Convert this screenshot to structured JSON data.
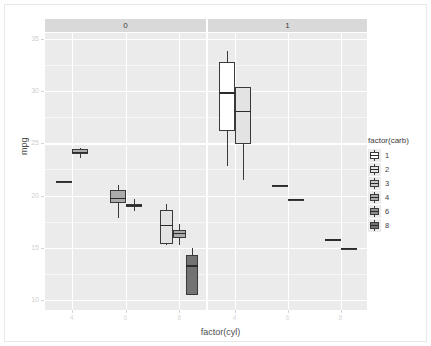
{
  "chart_data": {
    "type": "box",
    "title": "",
    "xlabel": "factor(cyl)",
    "ylabel": "mpg",
    "ylim": [
      9.0,
      35.6
    ],
    "yticks": [
      10,
      15,
      20,
      25,
      30,
      35
    ],
    "ytick_labels": [
      "10",
      "15",
      "20",
      "25",
      "30",
      "35"
    ],
    "xticks": [
      4,
      6,
      8
    ],
    "xtick_labels": [
      "4",
      "6",
      "8"
    ],
    "grid": "major-minor-white-on-gray",
    "legend": {
      "title": "factor(carb)",
      "position": "right",
      "entries": [
        {
          "label": "1",
          "color": "#ffffff"
        },
        {
          "label": "2",
          "color": "#e3e3e3"
        },
        {
          "label": "3",
          "color": "#c8c8c8"
        },
        {
          "label": "4",
          "color": "#ababab"
        },
        {
          "label": "6",
          "color": "#8e8e8e"
        },
        {
          "label": "8",
          "color": "#737373"
        }
      ]
    },
    "facets": [
      {
        "label": "0",
        "panel": "left"
      },
      {
        "label": "1",
        "panel": "right"
      }
    ],
    "boxes": [
      {
        "facet": "0",
        "cyl": "4",
        "carb": "2",
        "fill": "#e3e3e3",
        "lower_whisker": 21.4,
        "q1": 21.4,
        "median": 21.4,
        "q3": 21.4,
        "upper_whisker": 21.4,
        "single_value": true
      },
      {
        "facet": "0",
        "cyl": "4",
        "carb": "4",
        "fill": "#ababab",
        "lower_whisker": 23.6,
        "q1": 24.0,
        "median": 24.2,
        "q3": 24.5,
        "upper_whisker": 24.6,
        "single_value": false
      },
      {
        "facet": "0",
        "cyl": "6",
        "carb": "4",
        "fill": "#ababab",
        "lower_whisker": 17.8,
        "q1": 19.3,
        "median": 19.8,
        "q3": 20.5,
        "upper_whisker": 21.0,
        "single_value": false
      },
      {
        "facet": "0",
        "cyl": "6",
        "carb": "6",
        "fill": "#8e8e8e",
        "lower_whisker": 18.5,
        "q1": 18.9,
        "median": 19.1,
        "q3": 19.2,
        "upper_whisker": 19.7,
        "single_value": false
      },
      {
        "facet": "0",
        "cyl": "8",
        "carb": "2",
        "fill": "#e3e3e3",
        "lower_whisker": 15.2,
        "q1": 15.3,
        "median": 17.2,
        "q3": 18.6,
        "upper_whisker": 19.2,
        "single_value": false
      },
      {
        "facet": "0",
        "cyl": "8",
        "carb": "4",
        "fill": "#ababab",
        "lower_whisker": 15.2,
        "q1": 15.9,
        "median": 16.4,
        "q3": 16.7,
        "upper_whisker": 17.3,
        "single_value": false
      },
      {
        "facet": "0",
        "cyl": "8",
        "carb": "8",
        "fill": "#737373",
        "lower_whisker": 10.4,
        "q1": 10.4,
        "median": 13.3,
        "q3": 14.3,
        "upper_whisker": 15.0,
        "single_value": false
      },
      {
        "facet": "1",
        "cyl": "4",
        "carb": "1",
        "fill": "#ffffff",
        "lower_whisker": 22.8,
        "q1": 26.2,
        "median": 29.9,
        "q3": 32.8,
        "upper_whisker": 33.9,
        "single_value": false
      },
      {
        "facet": "1",
        "cyl": "4",
        "carb": "2",
        "fill": "#e3e3e3",
        "lower_whisker": 21.5,
        "q1": 24.9,
        "median": 28.1,
        "q3": 30.4,
        "upper_whisker": 30.4,
        "single_value": false
      },
      {
        "facet": "1",
        "cyl": "6",
        "carb": "1",
        "fill": "#ffffff",
        "lower_whisker": 21.0,
        "q1": 21.0,
        "median": 21.0,
        "q3": 21.0,
        "upper_whisker": 21.0,
        "single_value": true
      },
      {
        "facet": "1",
        "cyl": "6",
        "carb": "4",
        "fill": "#ababab",
        "lower_whisker": 19.7,
        "q1": 19.7,
        "median": 19.7,
        "q3": 19.7,
        "upper_whisker": 19.7,
        "single_value": true
      },
      {
        "facet": "1",
        "cyl": "8",
        "carb": "2",
        "fill": "#e3e3e3",
        "lower_whisker": 15.8,
        "q1": 15.8,
        "median": 15.8,
        "q3": 15.8,
        "upper_whisker": 15.8,
        "single_value": true
      },
      {
        "facet": "1",
        "cyl": "8",
        "carb": "4",
        "fill": "#ababab",
        "lower_whisker": 15.0,
        "q1": 15.0,
        "median": 15.0,
        "q3": 15.0,
        "upper_whisker": 15.0,
        "single_value": true
      }
    ]
  }
}
